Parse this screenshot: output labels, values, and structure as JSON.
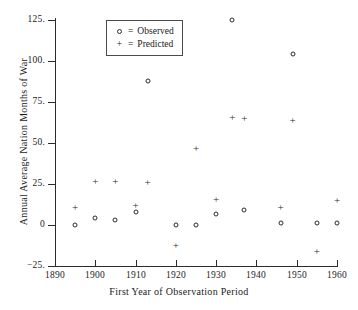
{
  "chart_data": {
    "type": "scatter",
    "title": "",
    "xlabel": "First Year of Observation Period",
    "ylabel": "Annual Average Nation Months of War",
    "xlim": [
      1890,
      1960
    ],
    "ylim": [
      -25,
      125
    ],
    "xticks": [
      1890,
      1900,
      1910,
      1920,
      1930,
      1940,
      1950,
      1960
    ],
    "xtick_labels": [
      "1890",
      "1900",
      "1910",
      "1920",
      "1930",
      "1940",
      "1950",
      "1960"
    ],
    "yticks": [
      -25,
      0,
      25,
      50,
      75,
      100,
      125
    ],
    "ytick_labels": [
      "-25.",
      "0",
      "25.",
      "50.",
      "75.",
      "100.",
      "125."
    ],
    "grid": false,
    "legend_position": "upper-left-inside",
    "marker_color": "#2b2b2b",
    "axis_color": "#2b2b2b",
    "series": [
      {
        "name": "Observed",
        "marker": "o",
        "legend_key": "o",
        "legend_text": "= Observed",
        "points": [
          {
            "x": 1895,
            "y": 0
          },
          {
            "x": 1900,
            "y": 4
          },
          {
            "x": 1905,
            "y": 3
          },
          {
            "x": 1910,
            "y": 8
          },
          {
            "x": 1913,
            "y": 88
          },
          {
            "x": 1920,
            "y": 0
          },
          {
            "x": 1925,
            "y": 0
          },
          {
            "x": 1930,
            "y": 7
          },
          {
            "x": 1934,
            "y": 125
          },
          {
            "x": 1937,
            "y": 9
          },
          {
            "x": 1946,
            "y": 1
          },
          {
            "x": 1949,
            "y": 104
          },
          {
            "x": 1955,
            "y": 1
          },
          {
            "x": 1960,
            "y": 1
          }
        ]
      },
      {
        "name": "Predicted",
        "marker": "+",
        "legend_key": "+",
        "legend_text": "= Predicted",
        "points": [
          {
            "x": 1895,
            "y": 11
          },
          {
            "x": 1900,
            "y": 27
          },
          {
            "x": 1905,
            "y": 27
          },
          {
            "x": 1910,
            "y": 12
          },
          {
            "x": 1913,
            "y": 26
          },
          {
            "x": 1920,
            "y": -12
          },
          {
            "x": 1925,
            "y": 47
          },
          {
            "x": 1930,
            "y": 16
          },
          {
            "x": 1934,
            "y": 66
          },
          {
            "x": 1937,
            "y": 65
          },
          {
            "x": 1946,
            "y": 11
          },
          {
            "x": 1949,
            "y": 64
          },
          {
            "x": 1955,
            "y": -16
          },
          {
            "x": 1960,
            "y": 15
          }
        ]
      }
    ]
  },
  "legend": {
    "rows": [
      {
        "key": "o",
        "eq": "=",
        "label": "Observed"
      },
      {
        "key": "+",
        "eq": "=",
        "label": "Predicted"
      }
    ]
  }
}
